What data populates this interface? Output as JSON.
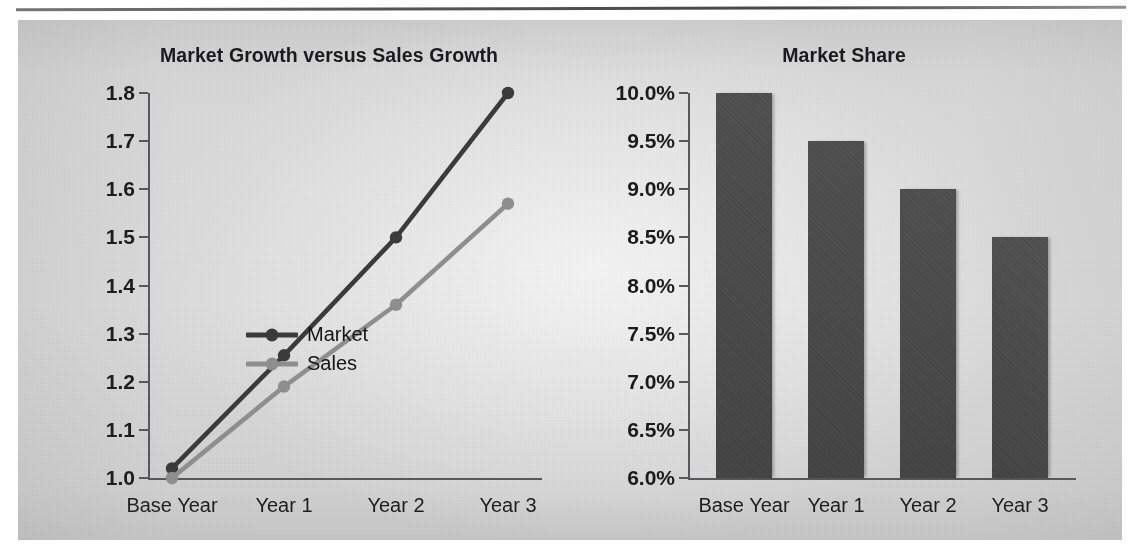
{
  "figure": {
    "panel_background": "#d8d8d8",
    "rule_color": "#4d4d4d"
  },
  "chart_data": [
    {
      "type": "line",
      "title": "Market Growth versus Sales Growth",
      "xlabel": "",
      "ylabel": "",
      "categories": [
        "Base Year",
        "Year 1",
        "Year 2",
        "Year 3"
      ],
      "ylim": [
        1.0,
        1.8
      ],
      "yticks": [
        "1.0",
        "1.1",
        "1.2",
        "1.3",
        "1.4",
        "1.5",
        "1.6",
        "1.7",
        "1.8"
      ],
      "ytick_values": [
        1.0,
        1.1,
        1.2,
        1.3,
        1.4,
        1.5,
        1.6,
        1.7,
        1.8
      ],
      "grid": false,
      "legend_position": "inside-lower-right",
      "series": [
        {
          "name": "Market",
          "values": [
            1.02,
            1.255,
            1.5,
            1.8
          ],
          "color": "#3b3b3b"
        },
        {
          "name": "Sales",
          "values": [
            1.0,
            1.19,
            1.36,
            1.57
          ],
          "color": "#8e8e8e"
        }
      ]
    },
    {
      "type": "bar",
      "title": "Market Share",
      "xlabel": "",
      "ylabel": "",
      "categories": [
        "Base Year",
        "Year 1",
        "Year 2",
        "Year 3"
      ],
      "values": [
        10.0,
        9.5,
        9.0,
        8.5
      ],
      "value_labels": [
        "10.0%",
        "9.5%",
        "9.0%",
        "8.5%"
      ],
      "ylim": [
        6.0,
        10.0
      ],
      "yticks": [
        "6.0%",
        "6.5%",
        "7.0%",
        "7.5%",
        "8.0%",
        "8.5%",
        "9.0%",
        "9.5%",
        "10.0%"
      ],
      "ytick_values": [
        6.0,
        6.5,
        7.0,
        7.5,
        8.0,
        8.5,
        9.0,
        9.5,
        10.0
      ],
      "grid": false,
      "bar_color": "#494949"
    }
  ]
}
